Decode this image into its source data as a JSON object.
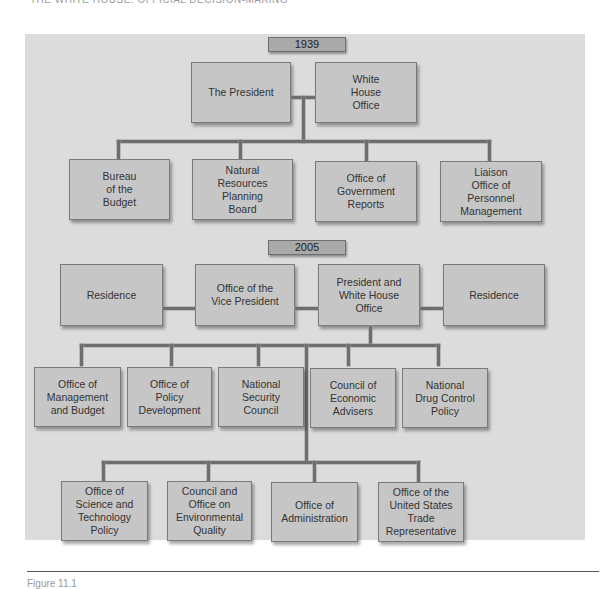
{
  "page_header": "THE WHITE HOUSE: OFFICIAL DECISION-MAKING",
  "chart_1939": {
    "year_label": "1939",
    "top": [
      {
        "label": "The President"
      },
      {
        "label": "White\nHouse\nOffice"
      }
    ],
    "children": [
      {
        "label": "Bureau\nof the\nBudget"
      },
      {
        "label": "Natural\nResources\nPlanning\nBoard"
      },
      {
        "label": "Office of\nGovernment\nReports"
      },
      {
        "label": "Liaison\nOffice of\nPersonnel\nManagement"
      }
    ]
  },
  "chart_2005": {
    "year_label": "2005",
    "top": [
      {
        "label": "Residence"
      },
      {
        "label": "Office of the\nVice President"
      },
      {
        "label": "President and\nWhite House\nOffice"
      },
      {
        "label": "Residence"
      }
    ],
    "row1": [
      {
        "label": "Office of\nManagement\nand Budget"
      },
      {
        "label": "Office of\nPolicy\nDevelopment"
      },
      {
        "label": "National\nSecurity\nCouncil"
      },
      {
        "label": "Council of\nEconomic\nAdvisers"
      },
      {
        "label": "National\nDrug Control\nPolicy"
      }
    ],
    "row2": [
      {
        "label": "Office of\nScience and\nTechnology\nPolicy"
      },
      {
        "label": "Council and\nOffice on\nEnvironmental\nQuality"
      },
      {
        "label": "Office of\nAdministration"
      },
      {
        "label": "Office of the\nUnited States\nTrade\nRepresentative"
      }
    ]
  },
  "caption": "Figure 11.1"
}
